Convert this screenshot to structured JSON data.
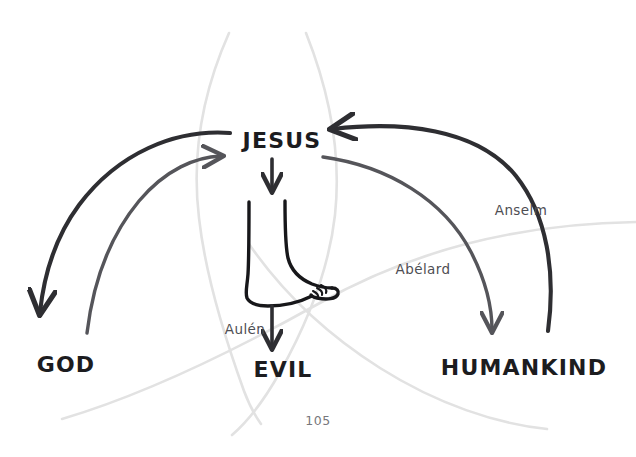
{
  "page": {
    "number": "105",
    "background_color": "#ffffff"
  },
  "palette": {
    "ink_dark": "#2e2e32",
    "ink_medium": "#55555a",
    "ink_faint": "#e2e2e2",
    "text_dark": "#1c1c1f",
    "text_label": "#4e4e53",
    "page_number_color": "#77777c"
  },
  "diagram": {
    "type": "atonement-theories",
    "nodes": [
      {
        "id": "jesus",
        "label": "JESUS",
        "x": 282,
        "y": 140
      },
      {
        "id": "god",
        "label": "GOD",
        "x": 66,
        "y": 365
      },
      {
        "id": "evil",
        "label": "EVIL",
        "x": 283,
        "y": 370
      },
      {
        "id": "humankind",
        "label": "HUMANKIND",
        "x": 524,
        "y": 368
      }
    ],
    "theory_labels": [
      {
        "id": "aulen",
        "label": "Aulén",
        "x": 245,
        "y": 330
      },
      {
        "id": "abelard",
        "label": "Abélard",
        "x": 423,
        "y": 270
      },
      {
        "id": "anselm",
        "label": "Anselm",
        "x": 521,
        "y": 211
      }
    ],
    "arrows": [
      {
        "id": "jesus-to-god",
        "from": "jesus",
        "to": "god",
        "weight": "dark",
        "arrowhead": "at-god"
      },
      {
        "id": "god-to-jesus",
        "from": "god",
        "to": "jesus",
        "weight": "medium",
        "arrowhead": "at-jesus"
      },
      {
        "id": "humankind-to-jesus",
        "from": "humankind",
        "to": "jesus",
        "weight": "dark",
        "arrowhead": "at-jesus"
      },
      {
        "id": "jesus-to-humankind",
        "from": "jesus",
        "to": "humankind",
        "weight": "medium",
        "arrowhead": "at-humankind"
      },
      {
        "id": "jesus-to-foot",
        "from": "jesus",
        "to": "foot",
        "weight": "dark",
        "arrowhead": "at-foot"
      },
      {
        "id": "foot-to-evil",
        "from": "foot",
        "to": "evil",
        "weight": "dark",
        "arrowhead": "at-evil"
      }
    ],
    "illustration": {
      "id": "foot",
      "name": "foot-illustration",
      "description": "line drawing of a bare foot and lower leg"
    },
    "background_curves": [
      {
        "id": "vesica-left"
      },
      {
        "id": "vesica-right"
      },
      {
        "id": "sweep-lower-left"
      },
      {
        "id": "sweep-lower-right"
      }
    ]
  }
}
